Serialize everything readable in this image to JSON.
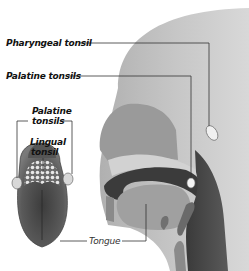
{
  "diagram": {
    "labels": {
      "pharyngeal_tonsil": "Pharyngeal tonsil",
      "palatine_tonsils_head": "Palatine tonsils",
      "palatine_tonsils_tongue_line1": "Palatine",
      "palatine_tonsils_tongue_line2": "tonsils",
      "lingual_tonsil_line1": "Lingual",
      "lingual_tonsil_line2": "tonsil",
      "tongue": "Tongue"
    },
    "colors": {
      "background": "#ffffff",
      "head_light": "#c8c8c8",
      "head_mid": "#a8a8a8",
      "cavity_dark": "#3a3a3a",
      "tongue_dark": "#4a4a4a",
      "leader_line": "#333333",
      "tonsil_highlight": "#f2f2f2"
    }
  }
}
